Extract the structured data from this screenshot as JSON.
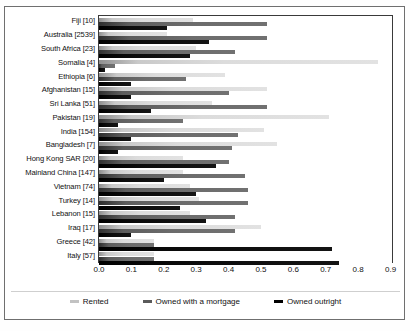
{
  "chart_data": {
    "type": "bar",
    "orientation": "horizontal",
    "title": "",
    "xlabel": "",
    "ylabel": "",
    "xlim": [
      0,
      0.9
    ],
    "grid": false,
    "legend_position": "bottom",
    "xticks": [
      "0.0",
      "0.1",
      "0.2",
      "0.3",
      "0.4",
      "0.5",
      "0.6",
      "0.7",
      "0.8",
      "0.9"
    ],
    "xtick_values": [
      0.0,
      0.1,
      0.2,
      0.3,
      0.4,
      0.5,
      0.6,
      0.7,
      0.8,
      0.9
    ],
    "categories": [
      "Fiji [10]",
      "Australia [2539]",
      "South Africa [23]",
      "Somalia [4]",
      "Ethiopia [6]",
      "Afghanistan [15]",
      "Sri Lanka [51]",
      "Pakistan [19]",
      "India [154]",
      "Bangladesh [7]",
      "Hong Kong SAR [20]",
      "Mainland China [147]",
      "Vietnam [74]",
      "Turkey [14]",
      "Lebanon [15]",
      "Iraq [17]",
      "Greece [42]",
      "Italy [57]"
    ],
    "series": [
      {
        "name": "Rented",
        "color": "#d0d0d0",
        "values": [
          0.29,
          0.21,
          0.3,
          0.86,
          0.39,
          0.52,
          0.35,
          0.71,
          0.51,
          0.55,
          0.26,
          0.26,
          0.28,
          0.31,
          0.28,
          0.5,
          0.17,
          0.17
        ]
      },
      {
        "name": "Owned with a mortgage",
        "color": "#666666",
        "values": [
          0.52,
          0.52,
          0.42,
          0.05,
          0.27,
          0.4,
          0.52,
          0.26,
          0.43,
          0.41,
          0.4,
          0.45,
          0.46,
          0.46,
          0.42,
          0.42,
          0.17,
          0.17
        ]
      },
      {
        "name": "Owned outright",
        "color": "#000000",
        "values": [
          0.21,
          0.34,
          0.28,
          0.02,
          0.1,
          0.1,
          0.16,
          0.06,
          0.1,
          0.06,
          0.36,
          0.2,
          0.3,
          0.25,
          0.33,
          0.1,
          0.72,
          0.74
        ]
      }
    ]
  },
  "legend": {
    "items": [
      {
        "label": "Rented",
        "swatch": "rented"
      },
      {
        "label": "Owned with a mortgage",
        "swatch": "mortgage"
      },
      {
        "label": "Owned outright",
        "swatch": "outright"
      }
    ]
  }
}
